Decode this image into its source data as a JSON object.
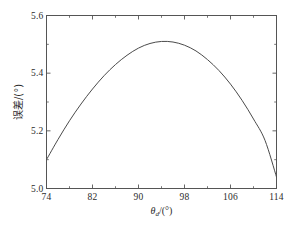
{
  "figure": {
    "background_color": "#ffffff",
    "frame_color": "#555555",
    "curve_color": "#4a4a4a",
    "text_color": "#2b2b2b"
  },
  "axes": {
    "x_title_main": "θ",
    "x_title_sub": "d",
    "x_title_unit": "/(°)",
    "y_title": "误差/(°)"
  },
  "chart_data": {
    "type": "line",
    "title": "",
    "xlabel": "θ_d/(°)",
    "ylabel": "误差/(°)",
    "xlim": [
      74,
      114
    ],
    "ylim": [
      5.0,
      5.6
    ],
    "xticks": [
      74,
      82,
      90,
      98,
      106,
      114
    ],
    "xtick_labels": [
      "74",
      "82",
      "90",
      "98",
      "106",
      "114"
    ],
    "yticks": [
      5.0,
      5.2,
      5.4,
      5.6
    ],
    "ytick_labels": [
      "5.0",
      "5.2",
      "5.4",
      "5.6"
    ],
    "x_minor_step": 4,
    "y_minor_step": 0.1,
    "grid": false,
    "legend": null,
    "series": [
      {
        "name": "误差",
        "x": [
          74,
          76,
          78,
          80,
          82,
          84,
          86,
          88,
          90,
          92,
          94,
          96,
          98,
          100,
          102,
          104,
          106,
          108,
          110,
          112,
          114
        ],
        "y": [
          5.1,
          5.17,
          5.235,
          5.293,
          5.345,
          5.391,
          5.43,
          5.462,
          5.487,
          5.503,
          5.51,
          5.508,
          5.497,
          5.477,
          5.447,
          5.409,
          5.362,
          5.306,
          5.241,
          5.167,
          5.04
        ]
      }
    ]
  }
}
